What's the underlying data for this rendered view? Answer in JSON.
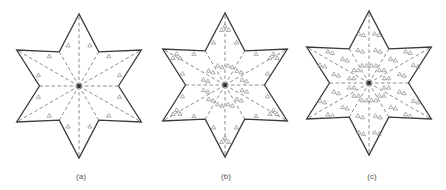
{
  "figure": {
    "style": {
      "outline_color": "#3a3a3a",
      "dash_color": "#6f6f6f",
      "triangle_color": "#8a8a8a",
      "center_dot_color": "#333333",
      "background": "#ffffff"
    },
    "panels": [
      {
        "id": "a",
        "label": "(a)",
        "label_pos": [
          81,
          173
        ],
        "center": [
          79,
          86
        ],
        "outer_radius": 72,
        "inner_radius": 39.5,
        "description": "Six-pointed star divided into 12 sectors by dashed radial lines; one small triangle marker in each sector",
        "triangles_per_sector": 1,
        "layout": "single"
      },
      {
        "id": "b",
        "label": "(b)",
        "label_pos": [
          226,
          173
        ],
        "center": [
          225,
          85
        ],
        "outer_radius": 72,
        "inner_radius": 39.5,
        "description": "Six-pointed star divided into 12 sectors; tip clusters of three triangles plus inner pairs of triangles",
        "triangles_per_sector": 3,
        "layout": "cluster"
      },
      {
        "id": "c",
        "label": "(c)",
        "label_pos": [
          372,
          173
        ],
        "center": [
          369,
          83
        ],
        "outer_radius": 72,
        "inner_radius": 39.5,
        "description": "Six-pointed star divided into 12 sectors; densely packed pairs of triangles in every sector",
        "triangles_per_sector": 6,
        "layout": "dense"
      }
    ]
  }
}
